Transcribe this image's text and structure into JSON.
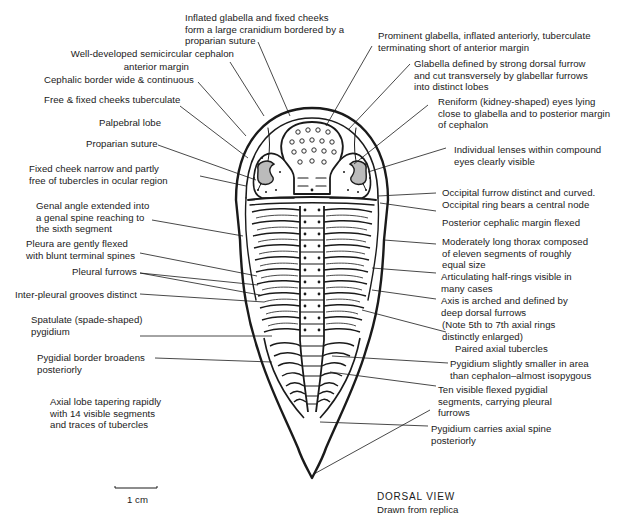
{
  "diagram": {
    "view_title": "DORSAL VIEW",
    "view_subtitle": "Drawn from replica",
    "scale_bar_label": "1 cm",
    "colors": {
      "ink": "#1a1a1a",
      "background": "#ffffff"
    }
  },
  "labels_left": [
    {
      "id": "inflated-glabella",
      "text": "Inflated glabella and fixed cheeks\nform a large cranidium bordered by a\nproparian suture"
    },
    {
      "id": "semicircular-cephalon",
      "text": "Well-developed semicircular cephalon"
    },
    {
      "id": "anterior-margin",
      "text": "anterior margin"
    },
    {
      "id": "cephalic-border",
      "text": "Cephalic border wide & continuous"
    },
    {
      "id": "cheeks-tuberculate",
      "text": "Free & fixed cheeks tuberculate"
    },
    {
      "id": "palpebral-lobe",
      "text": "Palpebral lobe"
    },
    {
      "id": "proparian-suture",
      "text": "Proparian suture"
    },
    {
      "id": "fixed-cheek-narrow",
      "text": "Fixed cheek narrow and partly\nfree of tubercles in ocular region"
    },
    {
      "id": "genal-angle",
      "text": "Genal angle extended into\na genal spine reaching to\nthe sixth segment"
    },
    {
      "id": "pleura-flexed",
      "text": "Pleura are gently flexed\nwith blunt terminal spines"
    },
    {
      "id": "pleural-furrows",
      "text": "Pleural furrows"
    },
    {
      "id": "inter-pleural-grooves",
      "text": "Inter-pleural grooves distinct"
    },
    {
      "id": "spatulate-pygidium",
      "text": "Spatulate (spade-shaped)\npygidium"
    },
    {
      "id": "pygidial-border",
      "text": "Pygidial border broadens\nposteriorly"
    },
    {
      "id": "axial-lobe",
      "text": "Axial lobe tapering rapidly\nwith 14 visible segments\nand traces of tubercles"
    }
  ],
  "labels_right": [
    {
      "id": "prominent-glabella",
      "text": "Prominent glabella, inflated anteriorly, tuberculate\nterminating short of anterior margin"
    },
    {
      "id": "glabella-defined",
      "text": "Glabella defined by strong dorsal furrow\nand cut transversely by glabellar furrows\ninto distinct lobes"
    },
    {
      "id": "reniform-eyes",
      "text": "Reniform (kidney-shaped) eyes lying\nclose to glabella and to posterior margin\nof cephalon"
    },
    {
      "id": "individual-lenses",
      "text": "Individual lenses within compound\neyes clearly visible"
    },
    {
      "id": "occipital-furrow",
      "text": "Occipital furrow distinct and curved.\nOccipital ring bears a central node"
    },
    {
      "id": "posterior-cephalic-margin",
      "text": "Posterior cephalic margin flexed"
    },
    {
      "id": "thorax",
      "text": "Moderately long thorax composed\nof eleven segments of roughly\nequal size"
    },
    {
      "id": "half-rings",
      "text": "Articulating half-rings visible in\nmany cases"
    },
    {
      "id": "axis-arched",
      "text": "Axis is arched and defined by\ndeep dorsal furrows"
    },
    {
      "id": "axial-rings-note",
      "text": "(Note 5th to 7th axial rings\ndistinctly enlarged)"
    },
    {
      "id": "paired-tubercles",
      "text": "Paired axial tubercles"
    },
    {
      "id": "pygidium-smaller",
      "text": "Pygidium slightly smaller in area\nthan cephalon–almost isopygous"
    },
    {
      "id": "ten-segments",
      "text": "Ten visible flexed pygidial\nsegments, carrying pleural\nfurrows"
    },
    {
      "id": "axial-spine",
      "text": "Pygidium carries axial spine\nposteriorly"
    }
  ]
}
